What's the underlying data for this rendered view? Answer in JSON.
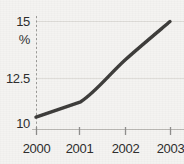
{
  "chart_data": {
    "type": "line",
    "title": "",
    "subtitle": "",
    "xlabel": "",
    "ylabel": "%",
    "categories": [
      "2000",
      "2001",
      "2002",
      "2003"
    ],
    "x": [
      2000,
      2001,
      2002,
      2003
    ],
    "values": [
      10,
      10.8,
      13,
      15
    ],
    "series": [
      {
        "name": "",
        "values": [
          10,
          10.8,
          13,
          15
        ]
      }
    ],
    "ylim": [
      9.35,
      15
    ],
    "xlim": [
      1999.72,
      2003
    ],
    "ytick_labels": [
      "15",
      "12.5",
      "10"
    ],
    "ytick_values": [
      15,
      12.5,
      10
    ],
    "xtick_labels": [
      "2000",
      "2001",
      "2002",
      "2003"
    ],
    "xtick_values": [
      2000,
      2001,
      2002,
      2003
    ],
    "grid": "horizontal",
    "legend": "none",
    "line_color": "#3b3a38",
    "line_width": 3.4,
    "axis_color": "#8d8c8a",
    "grid_color": "#dedcd8",
    "background_color": "#f4f3f1",
    "text_color": "#2a2a2a",
    "y_axis_style": "dashed",
    "x_axis_style": "solid"
  },
  "axes": {
    "y_unit_label": "%",
    "y_ticks": [
      {
        "label": "15",
        "value": 15
      },
      {
        "label": "12.5",
        "value": 12.5
      },
      {
        "label": "10",
        "value": 10
      }
    ],
    "x_ticks": [
      {
        "label": "2000",
        "value": 2000
      },
      {
        "label": "2001",
        "value": 2001
      },
      {
        "label": "2002",
        "value": 2002
      },
      {
        "label": "2003",
        "value": 2003
      }
    ]
  }
}
